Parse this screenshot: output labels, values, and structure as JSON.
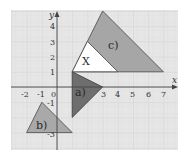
{
  "diagram": {
    "type": "coordinate-grid-transformations",
    "axes": {
      "x_label": "x",
      "y_label": "y",
      "x_ticks": [
        "-2",
        "-1",
        "0",
        "3",
        "4",
        "5",
        "6",
        "7"
      ],
      "y_ticks": [
        "4",
        "3",
        "2",
        "1",
        "-1",
        "-3"
      ],
      "x_range": [
        -3,
        8
      ],
      "y_range": [
        -4,
        5
      ]
    },
    "colors": {
      "grid_background": "#e6e6e6",
      "grid_line": "#cfcfcf",
      "axis": "#444444",
      "shape_X": "#ffffff",
      "shape_a": "#6e6e6e",
      "shape_b": "#a9a9a9",
      "shape_c": "#a6a6a6",
      "outline": "#555555"
    },
    "shapes": [
      {
        "id": "X",
        "label": "X",
        "vertices": [
          [
            1,
            1
          ],
          [
            2,
            3
          ],
          [
            4,
            1
          ]
        ]
      },
      {
        "id": "a",
        "label": "a)",
        "vertices": [
          [
            1,
            1
          ],
          [
            1,
            -2
          ],
          [
            3,
            0
          ]
        ]
      },
      {
        "id": "b",
        "label": "b)",
        "vertices": [
          [
            -1,
            -1
          ],
          [
            -2,
            -3
          ],
          [
            1,
            -3
          ]
        ]
      },
      {
        "id": "c",
        "label": "c)",
        "vertices": [
          [
            1,
            1
          ],
          [
            3,
            5
          ],
          [
            7,
            1
          ]
        ]
      }
    ]
  },
  "labels": {
    "x_axis": "x",
    "y_axis": "y",
    "tick_x_m2": "-2",
    "tick_x_m1": "-1",
    "tick_x_0": "0",
    "tick_x_3": "3",
    "tick_x_4": "4",
    "tick_x_5": "5",
    "tick_x_6": "6",
    "tick_x_7": "7",
    "tick_y_4": "4",
    "tick_y_3": "3",
    "tick_y_2": "2",
    "tick_y_1": "1",
    "tick_y_m1": "-1",
    "tick_y_m3": "-3",
    "shape_X": "X",
    "shape_a": "a)",
    "shape_b": "b)",
    "shape_c": "c)"
  }
}
